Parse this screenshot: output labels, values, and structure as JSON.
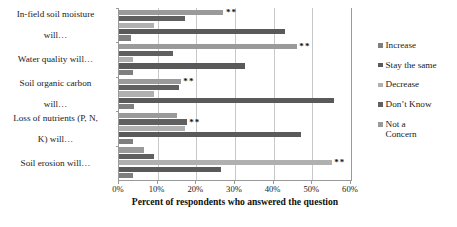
{
  "chart_data": {
    "type": "bar",
    "orientation": "horizontal",
    "title": "",
    "xlabel": "Percent of respondents who answered the question",
    "ylabel": "",
    "xlim": [
      0,
      60
    ],
    "xticks": [
      0,
      10,
      20,
      30,
      40,
      50,
      60
    ],
    "xtick_labels": [
      "0%",
      "10%",
      "20%",
      "30%",
      "40%",
      "50%",
      "60%"
    ],
    "grid": "vertical",
    "legend_position": "right",
    "categories": [
      "In-field soil moisture will…",
      "Water quality will…",
      "Soil organic carbon will…",
      "Loss of nutrients (P, N, K) will…",
      "Soil erosion will…"
    ],
    "series": [
      {
        "name": "Increase",
        "color": "#7f7f7f",
        "values": [
          3.0,
          3.5,
          4.0,
          3.5,
          3.5
        ]
      },
      {
        "name": "Stay the same",
        "color": "#5a5a5a",
        "values": [
          43.0,
          32.5,
          55.5,
          47.0,
          26.5
        ]
      },
      {
        "name": "Decrease",
        "color": "#b0b0b0",
        "values": [
          9.0,
          3.5,
          9.0,
          17.0,
          55.0
        ]
      },
      {
        "name": "Don't Know",
        "color": "#606060",
        "values": [
          17.0,
          14.0,
          15.5,
          17.5,
          9.0
        ]
      },
      {
        "name": "Not a Concern",
        "color": "#9a9a9a",
        "values": [
          27.0,
          46.0,
          16.0,
          15.0,
          6.5
        ]
      }
    ],
    "significance_marker": "**",
    "significance_cells": [
      {
        "category": "In-field soil moisture will…",
        "series": "Not a Concern"
      },
      {
        "category": "Water quality will…",
        "series": "Not a Concern"
      },
      {
        "category": "Soil organic carbon will…",
        "series": "Not a Concern"
      },
      {
        "category": "Loss of nutrients (P, N, K) will…",
        "series": "Don't Know"
      },
      {
        "category": "Soil erosion will…",
        "series": "Decrease"
      }
    ]
  },
  "legend": {
    "items": [
      {
        "label": "Increase",
        "color": "#7f7f7f"
      },
      {
        "label": "Stay the same",
        "color": "#5a5a5a"
      },
      {
        "label": "Decrease",
        "color": "#b0b0b0"
      },
      {
        "label": "Don’t Know",
        "color": "#606060"
      },
      {
        "label": "Not a Concern",
        "color": "#9a9a9a"
      }
    ]
  },
  "axis": {
    "title": "Percent of respondents who answered the question"
  },
  "category_labels": [
    [
      "In-field soil moisture",
      "will…"
    ],
    [
      "Water quality will…"
    ],
    [
      "Soil organic carbon",
      "will…"
    ],
    [
      "Loss of nutrients (P, N,",
      "K) will…"
    ],
    [
      "Soil erosion will…"
    ]
  ]
}
